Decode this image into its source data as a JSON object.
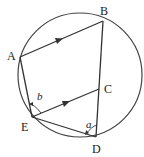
{
  "figure": {
    "type": "circle-geometry",
    "circle": {
      "cx": 80,
      "cy": 75,
      "r": 62
    },
    "points": {
      "A": {
        "label": "A",
        "x": 20,
        "y": 57,
        "label_x": 7,
        "label_y": 60
      },
      "B": {
        "label": "B",
        "x": 103,
        "y": 21,
        "label_x": 102,
        "label_y": 15
      },
      "C": {
        "label": "C",
        "x": 99,
        "y": 89,
        "label_x": 104,
        "label_y": 93
      },
      "D": {
        "label": "D",
        "x": 96,
        "y": 137,
        "label_x": 92,
        "label_y": 152
      },
      "E": {
        "label": "E",
        "x": 32,
        "y": 117,
        "label_x": 21,
        "label_y": 131
      }
    },
    "segments": [
      {
        "from": "A",
        "to": "B",
        "parallel_marker": true
      },
      {
        "from": "B",
        "to": "D",
        "parallel_marker": false
      },
      {
        "from": "A",
        "to": "E",
        "parallel_marker": false
      },
      {
        "from": "E",
        "to": "C",
        "parallel_marker": true
      },
      {
        "from": "E",
        "to": "D",
        "parallel_marker": false
      }
    ],
    "angles": [
      {
        "label": "a",
        "at": "D",
        "between": [
          "E",
          "C"
        ],
        "label_x": 86,
        "label_y": 128
      },
      {
        "label": "b",
        "at": "E",
        "between": [
          "A",
          "C"
        ],
        "label_x": 37,
        "label_y": 100
      }
    ]
  }
}
